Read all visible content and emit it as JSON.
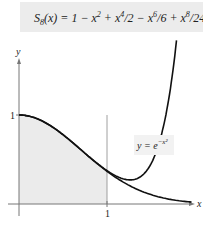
{
  "chart_data": {
    "type": "line",
    "xlabel": "x",
    "ylabel": "y",
    "x_ticks": [
      "1"
    ],
    "y_ticks": [
      "1"
    ],
    "xlim": [
      -0.05,
      2.0
    ],
    "ylim": [
      -0.1,
      1.9
    ],
    "series": [
      {
        "name": "y = e^{-x^2}",
        "function": "exp(-x^2)"
      },
      {
        "name": "S_8(x)",
        "function": "1 - x^2 + x^4/2 - x^6/6 + x^8/24"
      }
    ],
    "shaded_region": {
      "from_x": 0,
      "to_x": 1,
      "under": "e^{-x^2}"
    },
    "annotations": [
      "S_8(x) = 1 − x² + x⁴/2 − x⁶/6 + x⁸/24",
      "y = e^{−x²}"
    ]
  },
  "formula": {
    "text": "S₈(x) = 1 − x² + x⁴/2 − x⁶/6 + x⁸/24"
  },
  "labels": {
    "x_axis": "x",
    "y_axis": "y",
    "x_tick": "1",
    "y_tick": "1",
    "curve": "y = e"
  }
}
